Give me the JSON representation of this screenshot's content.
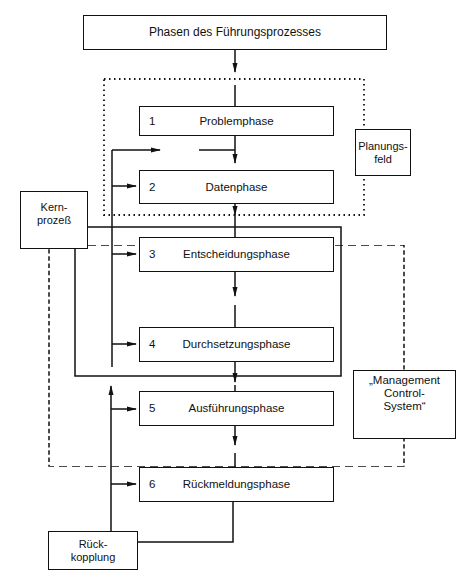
{
  "diagram": {
    "title": "Phasen des Führungsprozesses",
    "phases": [
      {
        "num": "1",
        "label": "Problemphase"
      },
      {
        "num": "2",
        "label": "Datenphase"
      },
      {
        "num": "3",
        "label": "Entscheidungsphase"
      },
      {
        "num": "4",
        "label": "Durchsetzungsphase"
      },
      {
        "num": "5",
        "label": "Ausführungsphase"
      },
      {
        "num": "6",
        "label": "Rückmeldungsphase"
      }
    ],
    "side_boxes": {
      "planungsfeld": {
        "line1": "Planungs-",
        "line2": "feld"
      },
      "kernprozess": {
        "line1": "Kern-",
        "line2": "prozeß"
      },
      "management": {
        "line1": "„Management",
        "line2": "Control-",
        "line3": "System“"
      },
      "rueckkopplung": {
        "line1": "Rück-",
        "line2": "kopplung"
      }
    },
    "line_color": "#111111"
  }
}
